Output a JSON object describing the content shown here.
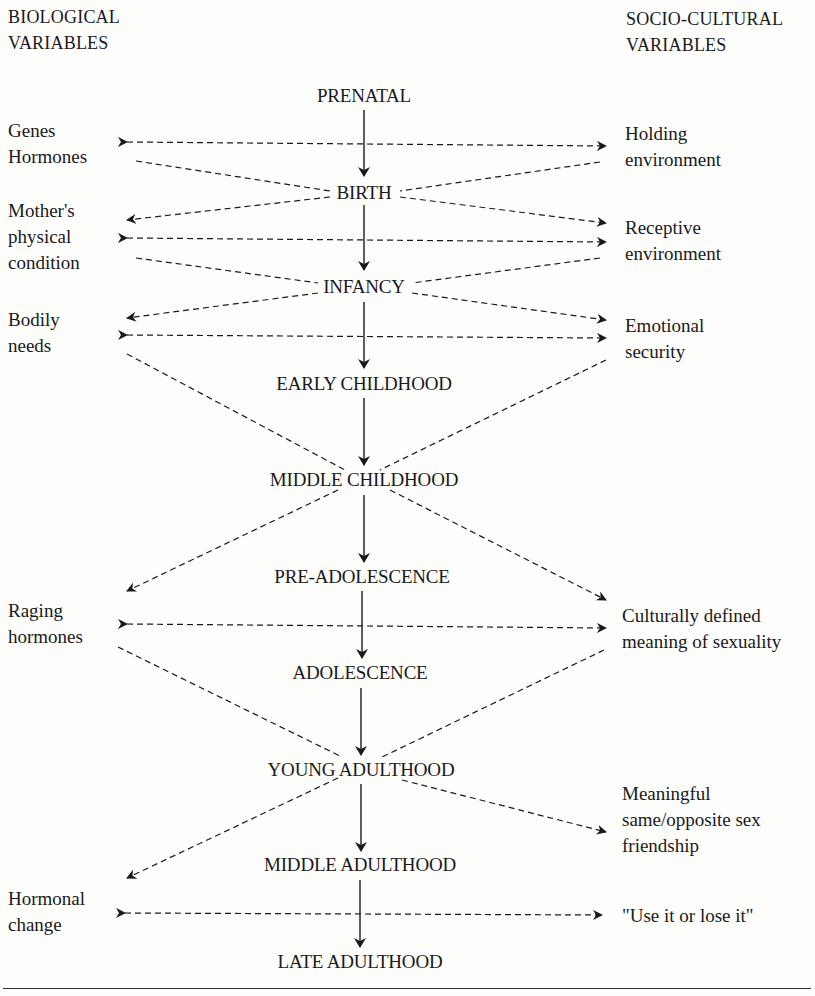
{
  "headers": {
    "left": [
      "BIOLOGICAL",
      "VARIABLES"
    ],
    "right": [
      "SOCIO-CULTURAL",
      "VARIABLES"
    ]
  },
  "stages": [
    {
      "label": "PRENATAL",
      "x": 364,
      "y": 84
    },
    {
      "label": "BIRTH",
      "x": 364,
      "y": 181
    },
    {
      "label": "INFANCY",
      "x": 364,
      "y": 275
    },
    {
      "label": "EARLY CHILDHOOD",
      "x": 364,
      "y": 372
    },
    {
      "label": "MIDDLE CHILDHOOD",
      "x": 364,
      "y": 468
    },
    {
      "label": "PRE-ADOLESCENCE",
      "x": 362,
      "y": 565
    },
    {
      "label": "ADOLESCENCE",
      "x": 360,
      "y": 661
    },
    {
      "label": "YOUNG ADULTHOOD",
      "x": 361,
      "y": 758
    },
    {
      "label": "MIDDLE ADULTHOOD",
      "x": 360,
      "y": 853
    },
    {
      "label": "LATE ADULTHOOD",
      "x": 360,
      "y": 950
    }
  ],
  "biological_variables": [
    {
      "lines": [
        "Genes",
        "Hormones"
      ],
      "x": 8,
      "y": 118
    },
    {
      "lines": [
        "Mother's",
        "physical",
        "condition"
      ],
      "x": 8,
      "y": 198
    },
    {
      "lines": [
        "Bodily",
        "needs"
      ],
      "x": 8,
      "y": 307
    },
    {
      "lines": [
        "Raging",
        "hormones"
      ],
      "x": 8,
      "y": 598
    },
    {
      "lines": [
        "Hormonal",
        "change"
      ],
      "x": 8,
      "y": 886
    }
  ],
  "socio_cultural_variables": [
    {
      "lines": [
        "Holding",
        "environment"
      ],
      "x": 625,
      "y": 121
    },
    {
      "lines": [
        "Receptive",
        "environment"
      ],
      "x": 625,
      "y": 215
    },
    {
      "lines": [
        "Emotional",
        "security"
      ],
      "x": 625,
      "y": 313
    },
    {
      "lines": [
        "Culturally defined",
        "meaning of sexuality"
      ],
      "x": 622,
      "y": 603
    },
    {
      "lines": [
        "Meaningful",
        "same/opposite sex",
        "friendship"
      ],
      "x": 622,
      "y": 781
    },
    {
      "lines": [
        "\"Use it or lose it\""
      ],
      "x": 622,
      "y": 903
    }
  ],
  "connections": {
    "stage_arrows": "solid downward arrows connect each life stage to the next",
    "bidirectional": "dashed double-headed arrows link biological and socio-cultural variables",
    "converging": "dashed lines from variables converge on life stages"
  }
}
